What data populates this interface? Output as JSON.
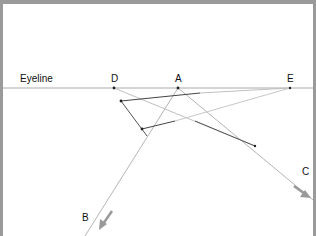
{
  "diagram": {
    "eyeline_label": "Eyeline",
    "points": {
      "D": {
        "label": "D",
        "x": 114,
        "y": 88
      },
      "A": {
        "label": "A",
        "x": 178,
        "y": 88
      },
      "E": {
        "label": "E",
        "x": 290,
        "y": 88
      }
    },
    "ray_labels": {
      "B": "B",
      "C": "C"
    },
    "colors": {
      "frame": "#9a9a9a",
      "line_dark": "#444444",
      "line_light": "#b0b0b0",
      "arrow": "#999999",
      "eyeline": "#aaaaaa"
    }
  }
}
